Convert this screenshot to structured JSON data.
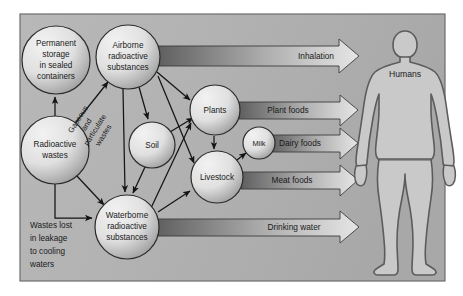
{
  "figure": {
    "background_color": "#ffffff",
    "panel_color": "#b3b3b3",
    "panel_border_color": "#6d6d6d",
    "node_fill_light": "#e8e8e8",
    "node_fill_shadow": "#9a9a9a",
    "node_stroke": "#2b2b2b",
    "band_dark": "#6b6b6b",
    "band_light": "#dcdcdc",
    "arrow_stroke": "#202020",
    "human_fill": "#c9c9c9",
    "human_stroke": "#5c5c5c"
  },
  "nodes": [
    {
      "id": "permanent-storage",
      "label_lines": [
        "Permanent",
        "storage",
        "in sealed",
        "containers"
      ],
      "cx": 56,
      "cy": 60,
      "r": 34
    },
    {
      "id": "airborne",
      "label_lines": [
        "Airborne",
        "radioactive",
        "substances"
      ],
      "cx": 128,
      "cy": 57,
      "r": 32
    },
    {
      "id": "radioactive-wastes",
      "label_lines": [
        "Radioactive",
        "wastes"
      ],
      "cx": 55,
      "cy": 150,
      "r": 34
    },
    {
      "id": "soil",
      "label_lines": [
        "Soil"
      ],
      "cx": 152,
      "cy": 145,
      "r": 23
    },
    {
      "id": "plants",
      "label_lines": [
        "Plants"
      ],
      "cx": 215,
      "cy": 110,
      "r": 25
    },
    {
      "id": "livestock",
      "label_lines": [
        "Livestock"
      ],
      "cx": 217,
      "cy": 177,
      "r": 26
    },
    {
      "id": "milk",
      "label_lines": [
        "Milk"
      ],
      "cx": 259,
      "cy": 143,
      "r": 16
    },
    {
      "id": "waterborne",
      "label_lines": [
        "Waterborne",
        "radioactive",
        "substances"
      ],
      "cx": 127,
      "cy": 227,
      "r": 32
    }
  ],
  "bands": [
    {
      "id": "inhalation",
      "label": "Inhalation",
      "x1": 158,
      "y": 56,
      "x2": 357,
      "label_x": 316,
      "thickness": 20
    },
    {
      "id": "plant-foods",
      "label": "Plant foods",
      "x1": 239,
      "y": 110,
      "x2": 357,
      "label_x": 285,
      "thickness": 17
    },
    {
      "id": "dairy-foods",
      "label": "Dairy foods",
      "x1": 272,
      "y": 143,
      "x2": 357,
      "label_x": 283,
      "thickness": 17
    },
    {
      "id": "meat-foods",
      "label": "Meat foods",
      "x1": 241,
      "y": 180,
      "x2": 357,
      "label_x": 292,
      "thickness": 17
    },
    {
      "id": "drinking-water",
      "label": "Drinking water",
      "x1": 156,
      "y": 227,
      "x2": 357,
      "label_x": 291,
      "thickness": 17
    }
  ],
  "free_labels": [
    {
      "id": "gaseous-particulate",
      "lines": [
        "Gaseous",
        "and",
        "particulate",
        "wastes"
      ],
      "x": 92,
      "y": 128,
      "rotation": -58
    },
    {
      "id": "wastes-lost",
      "lines": [
        "Wastes lost",
        "in leakage",
        "to cooling",
        "waters"
      ],
      "x": 38,
      "y": 226
    }
  ],
  "human": {
    "id": "humans",
    "label": "Humans",
    "label_x": 405,
    "label_y": 75
  },
  "connections": [
    {
      "from": "radioactive-wastes",
      "to": "permanent-storage",
      "kind": "arrow"
    },
    {
      "from": "radioactive-wastes",
      "to": "airborne",
      "kind": "arrow",
      "note": "gaseous and particulate wastes"
    },
    {
      "from": "radioactive-wastes",
      "to": "waterborne",
      "kind": "arrow"
    },
    {
      "from": "radioactive-wastes",
      "to": "waterborne",
      "kind": "elbow",
      "note": "wastes lost in leakage to cooling waters"
    },
    {
      "from": "airborne",
      "to": "soil",
      "kind": "arrow"
    },
    {
      "from": "airborne",
      "to": "plants",
      "kind": "arrow"
    },
    {
      "from": "airborne",
      "to": "livestock",
      "kind": "arrow"
    },
    {
      "from": "airborne",
      "to": "waterborne",
      "kind": "arrow"
    },
    {
      "from": "soil",
      "to": "plants",
      "kind": "arrow"
    },
    {
      "from": "soil",
      "to": "waterborne",
      "kind": "arrow"
    },
    {
      "from": "plants",
      "to": "livestock",
      "kind": "arrow"
    },
    {
      "from": "livestock",
      "to": "milk",
      "kind": "arrow"
    },
    {
      "from": "waterborne",
      "to": "plants",
      "kind": "arrow"
    },
    {
      "from": "waterborne",
      "to": "livestock",
      "kind": "arrow"
    }
  ]
}
